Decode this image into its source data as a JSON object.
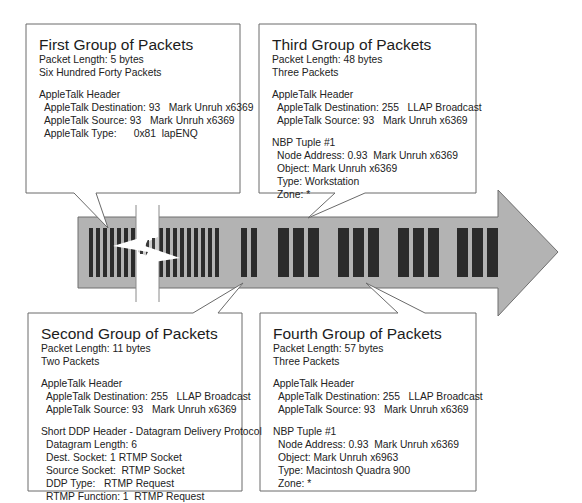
{
  "diagram": {
    "arrow_color": "#b0b0b0",
    "packet_color": "#2b2b2b",
    "break_gap": true
  },
  "callouts": {
    "first": {
      "title": "First Group of Packets",
      "length": "Packet Length: 5 bytes",
      "count": "Six Hundred Forty Packets",
      "sections": {
        "header": {
          "heading": "AppleTalk Header",
          "lines": [
            "AppleTalk Destination: 93   Mark Unruh x6369",
            "AppleTalk Source: 93   Mark Unruh x6369",
            "AppleTalk Type:      0x81  lapENQ"
          ]
        }
      }
    },
    "second": {
      "title": "Second Group of Packets",
      "length": "Packet Length: 11 bytes",
      "count": "Two Packets",
      "sections": {
        "header": {
          "heading": "AppleTalk Header",
          "lines": [
            "AppleTalk Destination: 255   LLAP Broadcast",
            "AppleTalk Source: 93   Mark Unruh x6369"
          ]
        },
        "ddp": {
          "heading": "Short DDP Header - Datagram Delivery Protocol",
          "lines": [
            "Datagram Length: 6",
            "Dest. Socket: 1 RTMP Socket",
            "Source Socket:  RTMP Socket",
            "DDP Type:   RTMP Request",
            "RTMP Function: 1  RTMP Request"
          ]
        }
      }
    },
    "third": {
      "title": "Third Group of Packets",
      "length": "Packet Length: 48 bytes",
      "count": "Three Packets",
      "sections": {
        "header": {
          "heading": "AppleTalk Header",
          "lines": [
            "AppleTalk Destination: 255   LLAP Broadcast",
            "AppleTalk Source: 93   Mark Unruh x6369"
          ]
        },
        "nbp": {
          "heading": "NBP Tuple #1",
          "lines": [
            "Node Address: 0.93  Mark Unruh x6369",
            "Object: Mark Unruh x6369",
            "Type: Workstation",
            "Zone: *"
          ]
        }
      }
    },
    "fourth": {
      "title": "Fourth Group of Packets",
      "length": "Packet Length: 57 bytes",
      "count": "Three Packets",
      "sections": {
        "header": {
          "heading": "AppleTalk Header",
          "lines": [
            "AppleTalk Destination: 255   LLAP Broadcast",
            "AppleTalk Source: 93   Mark Unruh x6369"
          ]
        },
        "nbp": {
          "heading": "NBP Tuple #1",
          "lines": [
            "Node Address: 0.93  Mark Unruh x6369",
            "Object: Mark Unruh x6963",
            "Type: Macintosh Quadra 900",
            "Zone: *"
          ]
        }
      }
    }
  }
}
